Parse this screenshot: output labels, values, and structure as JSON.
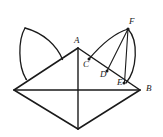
{
  "figure": {
    "kind": "geometry-diagram",
    "background_color": "#ffffff",
    "stroke_color": "#1a1a1a",
    "canvas": {
      "width": 163,
      "height": 137
    },
    "vertices": [
      {
        "id": "A",
        "label": "A",
        "x": 78,
        "y": 48,
        "label_x": 74,
        "label_y": 36
      },
      {
        "id": "B",
        "label": "B",
        "x": 140,
        "y": 90,
        "label_x": 146,
        "label_y": 84
      },
      {
        "id": "C",
        "label": "C",
        "x": 89,
        "y": 59,
        "label_x": 83,
        "label_y": 60
      },
      {
        "id": "D",
        "label": "D",
        "x": 107,
        "y": 71,
        "label_x": 100,
        "label_y": 70
      },
      {
        "id": "E",
        "label": "E",
        "x": 124,
        "y": 83,
        "label_x": 117,
        "label_y": 78
      },
      {
        "id": "F",
        "label": "F",
        "x": 128,
        "y": 29,
        "label_x": 129,
        "label_y": 17
      },
      {
        "id": "L",
        "label": "",
        "x": 14,
        "y": 90,
        "label_x": 0,
        "label_y": 0
      },
      {
        "id": "S",
        "label": "",
        "x": 78,
        "y": 129,
        "label_x": 0,
        "label_y": 0
      }
    ],
    "marked_points": [
      "C",
      "D",
      "E",
      "F"
    ],
    "segments": [
      {
        "name": "edge-left-upper",
        "from": "L",
        "to": "A"
      },
      {
        "name": "edge-right-upper",
        "from": "A",
        "to": "B"
      },
      {
        "name": "edge-left-lower",
        "from": "L",
        "to": "S"
      },
      {
        "name": "edge-right-lower",
        "from": "S",
        "to": "B"
      },
      {
        "name": "diagonal-horizontal",
        "from": "L",
        "to": "B"
      },
      {
        "name": "diagonal-vertical",
        "from": "A",
        "to": "S"
      },
      {
        "name": "chord-F-D",
        "from": "F",
        "to": "D"
      },
      {
        "name": "chord-F-E",
        "from": "F",
        "to": "E"
      }
    ],
    "petals": [
      {
        "name": "left-petal",
        "on_edge": "edge-left-upper",
        "apex_x": 25,
        "apex_y": 28,
        "foot_x": 26,
        "foot_y": 79,
        "attach_x": 62,
        "attach_y": 60
      },
      {
        "name": "right-petal",
        "on_edge": "edge-right-upper",
        "apex_id": "F",
        "foot_id": "C",
        "tip_id": "E"
      }
    ]
  }
}
